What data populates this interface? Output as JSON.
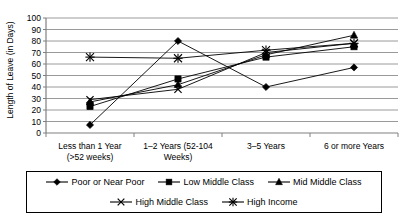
{
  "chart_data": {
    "type": "line",
    "title": "",
    "xlabel": "",
    "ylabel": "Length of Leave (in Days)",
    "ylim": [
      0,
      100
    ],
    "ytick_step": 10,
    "yticks": [
      "0",
      "10",
      "20",
      "30",
      "40",
      "50",
      "60",
      "70",
      "80",
      "90",
      "100"
    ],
    "grid": true,
    "legend_position": "bottom",
    "categories": [
      "Less than 1 Year (>52 weeks)",
      "1–2 Years (52-104 Weeks)",
      "3–5 Years",
      "6 or more Years"
    ],
    "category_lines": [
      [
        "Less than 1 Year",
        "(>52 weeks)"
      ],
      [
        "1–2 Years (52-104",
        "Weeks)"
      ],
      [
        "3–5 Years",
        ""
      ],
      [
        "6 or more Years",
        ""
      ]
    ],
    "series": [
      {
        "name": "Poor or Near Poor",
        "marker": "diamond",
        "values": [
          7,
          80,
          40,
          57
        ]
      },
      {
        "name": "Low Middle Class",
        "marker": "square",
        "values": [
          23,
          47,
          66,
          75
        ]
      },
      {
        "name": "Mid Middle Class",
        "marker": "triangle",
        "values": [
          27,
          42,
          68,
          85
        ]
      },
      {
        "name": "High Middle Class",
        "marker": "cross",
        "values": [
          29,
          38,
          70,
          78
        ]
      },
      {
        "name": "High Income",
        "marker": "asterisk",
        "values": [
          66,
          65,
          72,
          78
        ]
      }
    ],
    "colors": {
      "line": "#000000",
      "marker": "#000000",
      "grid": "#808080",
      "axis": "#808080",
      "background": "#ffffff"
    }
  },
  "legend": {
    "row1": [
      "Poor or Near Poor",
      "Low Middle Class",
      "Mid Middle Class"
    ],
    "row2": [
      "High Middle Class",
      "High Income"
    ]
  }
}
